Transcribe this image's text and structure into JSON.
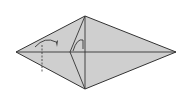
{
  "diagram": {
    "type": "origami-fold-step",
    "colors": {
      "paper": "#cfcfcf",
      "line": "#333333",
      "background": "#ffffff"
    },
    "shape": "kite-diamond",
    "annotations": {
      "valley_fold_arrow": "curved-arrow-right",
      "squash_arrow": "small-curved-arrow",
      "fold_line": "dashed-vertical"
    }
  }
}
